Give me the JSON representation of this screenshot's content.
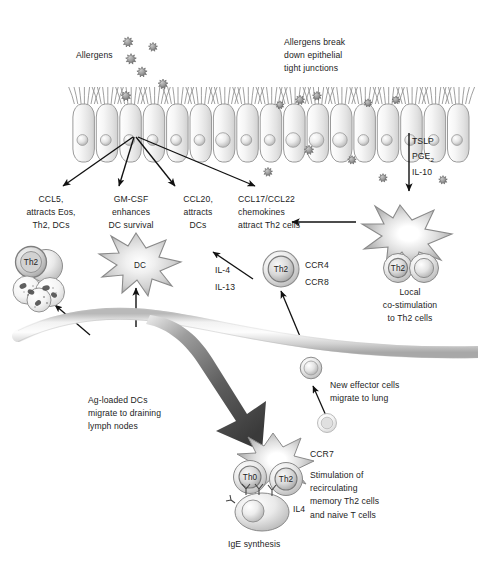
{
  "figure": {
    "background_color": "#ffffff",
    "text_color": "#1c1c1c",
    "cell_fill": "#f2f2f2",
    "cell_stroke": "#9a9a9a",
    "arrow_color": "#111111",
    "vessel_color": "#d6d6d6",
    "big_arrow_color": "#4a4a4a"
  },
  "labels": {
    "allergens": "Allergens",
    "allergens_break": "Allergens break\ndown epithelial\ntight junctions",
    "ccl5": "CCL5,\nattracts Eos,\nTh2, DCs",
    "gmcsf": "GM-CSF\nenhances\nDC survival",
    "ccl20": "CCL20,\nattracts\nDCs",
    "ccl17": "CCL17/CCL22\nchemokines\nattract Th2 cells",
    "tslp": "TSLP",
    "pge2_base": "PGE",
    "pge2_sub": "2",
    "il10": "IL-10",
    "il4": "IL-4",
    "il13": "IL-13",
    "ccr4": "CCR4",
    "ccr8": "CCR8",
    "local_costim": "Local\nco-stimulation\nto Th2 cells",
    "ag_loaded": "Ag-loaded DCs\nmigrate to draining\nlymph nodes",
    "new_effector": "New effector cells\nmigrate to lung",
    "ccr7": "CCR7",
    "stimulation": "Stimulation of\nrecirculating\nmemory Th2 cells\nand naive T cells",
    "il4_lymph": "IL4",
    "ige": "IgE synthesis"
  },
  "cell_tags": {
    "dc_left": "DC",
    "th2_left": "Th2",
    "th2_center": "Th2",
    "th2_right": "Th2",
    "th0_lymph": "Th0",
    "th2_lymph": "Th2"
  },
  "epithelium": {
    "cell_count": 17,
    "description": "ciliated epithelial cell layer"
  },
  "allergen_particles": {
    "top_cluster_count": 6,
    "lower_cluster_count": 5,
    "description": "spiky allergen particles"
  }
}
